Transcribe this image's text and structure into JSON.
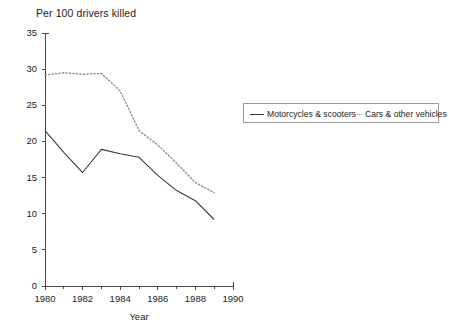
{
  "chart_data": {
    "type": "line",
    "title": "Per 100 drivers killed",
    "xlabel": "Year",
    "ylabel": "",
    "x": [
      1980,
      1981,
      1982,
      1983,
      1984,
      1985,
      1986,
      1987,
      1988,
      1989
    ],
    "xlim": [
      1980,
      1990
    ],
    "ylim": [
      0,
      35
    ],
    "ytick_labels": [
      "0",
      "5",
      "10",
      "15",
      "20",
      "25",
      "30",
      "35"
    ],
    "ytick_values": [
      0,
      5,
      10,
      15,
      20,
      25,
      30,
      35
    ],
    "xtick_labels": [
      "1980",
      "1982",
      "1984",
      "1986",
      "1988",
      "1990"
    ],
    "xtick_values": [
      1980,
      1982,
      1984,
      1986,
      1988,
      1990
    ],
    "x_minor_ticks": [
      1981,
      1983,
      1985,
      1987,
      1989
    ],
    "grid": false,
    "legend_position": "upper right outside",
    "series": [
      {
        "name": "Motorcycles & scooters",
        "style": "solid",
        "color": "#3b3b3b",
        "values": [
          21.5,
          18.5,
          15.7,
          18.9,
          18.3,
          17.8,
          15.3,
          13.2,
          11.8,
          9.2
        ]
      },
      {
        "name": "Cars & other vehicles",
        "style": "dotted",
        "color": "#8a8a8a",
        "values": [
          29.2,
          29.5,
          29.3,
          29.4,
          27.0,
          21.5,
          19.5,
          17.0,
          14.3,
          12.9
        ]
      }
    ]
  },
  "legend": {
    "entries": [
      {
        "label": "Motorcycles & scooters"
      },
      {
        "label": "Cars & other vehicles"
      }
    ]
  },
  "colors": {
    "axis": "#4a4a4a",
    "series_solid": "#3b3b3b",
    "series_dotted": "#8a8a8a",
    "text": "#222222",
    "background": "#ffffff"
  }
}
